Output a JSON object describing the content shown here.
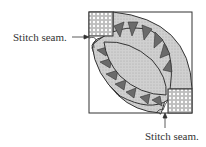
{
  "diagram": {
    "labels": [
      {
        "id": "left",
        "text": "Stitch seam.",
        "x": 13,
        "y": 32
      },
      {
        "id": "bottom",
        "text": "Stitch seam.",
        "x": 145,
        "y": 131
      }
    ],
    "colors": {
      "outline": "#333333",
      "dark_triangle": "#6b6b6b",
      "light_fill": "#c8c8c8",
      "dotted_fill": "#e4e4e4",
      "background": "#ffffff"
    }
  }
}
